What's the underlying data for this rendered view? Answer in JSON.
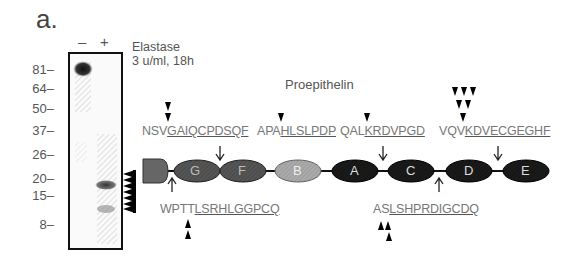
{
  "panel_label": "a.",
  "gel": {
    "lanes": [
      "–",
      "+"
    ],
    "treatment_line1": "Elastase",
    "treatment_line2": "3 u/ml, 18h",
    "mw_markers": [
      "81",
      "64",
      "50",
      "37",
      "26",
      "20",
      "15",
      "8"
    ]
  },
  "diagram": {
    "title": "Proepithelin",
    "domains": [
      "G",
      "F",
      "B",
      "A",
      "C",
      "D",
      "E"
    ],
    "top_sequences": [
      {
        "pre": "NSV",
        "underlined": "GAIQCPDSQF"
      },
      {
        "pre": "APA",
        "underlined": "HLSLPDP"
      },
      {
        "pre": "QAL",
        "underlined": "KRDVPGD"
      },
      {
        "pre": "VQV",
        "underlined": "KDVECGEGHF"
      }
    ],
    "bottom_sequences": [
      {
        "pre": "WPTT",
        "underlined": "LSRHLGGPCQ"
      },
      {
        "pre": "AS",
        "underlined": "LSHPRDIGCDQ"
      }
    ]
  }
}
